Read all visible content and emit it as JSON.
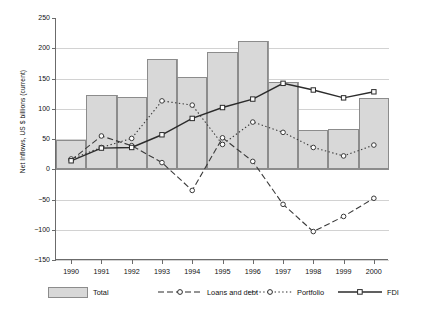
{
  "chart_data": {
    "type": "bar",
    "title": "",
    "xlabel": "",
    "ylabel": "Net Inflows, US $ billions (current)",
    "categories": [
      "1990",
      "1991",
      "1992",
      "1993",
      "1994",
      "1995",
      "1996",
      "1997",
      "1998",
      "1999",
      "2000"
    ],
    "ylim": [
      -150,
      250
    ],
    "yticks": [
      250,
      200,
      150,
      100,
      50,
      0,
      -50,
      -100,
      -150
    ],
    "ytick_labels": [
      "250",
      "200",
      "150",
      "100",
      "50",
      "0",
      "−50",
      "−100",
      "−150"
    ],
    "grid": true,
    "legend_position": "bottom",
    "series": [
      {
        "name": "Total",
        "kind": "bar",
        "color": "#d8d8d8",
        "values": [
          48,
          122,
          119,
          182,
          152,
          194,
          212,
          144,
          65,
          66,
          118
        ]
      },
      {
        "name": "Loans and debt",
        "kind": "line",
        "style": "dashed",
        "marker": "circle",
        "color": "#3a3a3a",
        "values": [
          15,
          55,
          39,
          11,
          -35,
          52,
          13,
          -58,
          -103,
          -78,
          -48
        ]
      },
      {
        "name": "Portfolio",
        "kind": "line",
        "style": "dotted",
        "marker": "circle",
        "color": "#3a3a3a",
        "values": [
          17,
          36,
          51,
          113,
          106,
          41,
          78,
          61,
          36,
          22,
          40
        ]
      },
      {
        "name": "FDI",
        "kind": "line",
        "style": "solid",
        "marker": "square",
        "color": "#2b2b2b",
        "values": [
          14,
          35,
          36,
          57,
          84,
          102,
          116,
          142,
          131,
          118,
          128
        ]
      }
    ]
  },
  "legend": {
    "items": [
      {
        "label": "Total",
        "kind": "bar"
      },
      {
        "label": "Loans and debt",
        "kind": "dashed-circle"
      },
      {
        "label": "Portfolio",
        "kind": "dotted-circle"
      },
      {
        "label": "FDI",
        "kind": "solid-square"
      }
    ]
  }
}
